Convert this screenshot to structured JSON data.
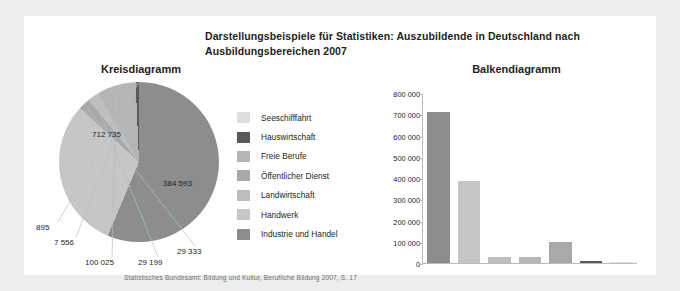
{
  "title": "Darstellungsbeispiele für Statistiken: Auszubildende in Deutschland nach Ausbildungsbereichen 2007",
  "pie_subtitle": "Kreisdiagramm",
  "bar_subtitle": "Balkendiagramm",
  "footer": "Statistisches Bundesamt: Bildung und Kultur, Berufliche Bildung 2007, S. 17",
  "legend": [
    {
      "label": "Seeschifffahrt",
      "color": "#dcdddd"
    },
    {
      "label": "Hauswirtschaft",
      "color": "#58595b"
    },
    {
      "label": "Freie Berufe",
      "color": "#b4b5b7"
    },
    {
      "label": "Öffentlicher Dienst",
      "color": "#a7a9ab"
    },
    {
      "label": "Landwirtschaft",
      "color": "#bdbec0"
    },
    {
      "label": "Handwerk",
      "color": "#c5c6c8"
    },
    {
      "label": "Industrie und Handel",
      "color": "#8b8d8f"
    }
  ],
  "chart_data": [
    {
      "type": "pie",
      "title": "Kreisdiagramm",
      "legend_position": "center",
      "categories": [
        "Industrie und Handel",
        "Handwerk",
        "Öffentlicher Dienst",
        "Landwirtschaft",
        "Freie Berufe",
        "Hauswirtschaft",
        "Seeschifffahrt"
      ],
      "values": [
        712735,
        384593,
        29333,
        29199,
        100025,
        7556,
        895
      ],
      "labels": [
        "712 735",
        "384 593",
        "29 333",
        "29 199",
        "100 025",
        "7 556",
        "895"
      ],
      "colors": [
        "#8b8d8f",
        "#c5c6c8",
        "#a7a9ab",
        "#bdbec0",
        "#b4b5b7",
        "#58595b",
        "#dcdddd"
      ],
      "total": 1264336
    },
    {
      "type": "bar",
      "title": "Balkendiagramm",
      "xlabel": "",
      "ylabel": "",
      "ylim": [
        0,
        800000
      ],
      "grid": false,
      "yticks": [
        800000,
        700000,
        600000,
        500000,
        400000,
        300000,
        200000,
        100000,
        0
      ],
      "ytick_labels": [
        "800 000",
        "700 000",
        "600 000",
        "500 000",
        "400 000",
        "300 000",
        "200 000",
        "100 000",
        "0"
      ],
      "categories": [
        "Industrie und Handel",
        "Handwerk",
        "Öffentlicher Dienst",
        "Landwirtschaft",
        "Freie Berufe",
        "Hauswirtschaft",
        "Seeschifffahrt"
      ],
      "values": [
        712735,
        384593,
        29333,
        29199,
        100025,
        7556,
        895
      ],
      "colors": [
        "#8b8d8f",
        "#c5c6c8",
        "#bdbec0",
        "#b4b5b7",
        "#a7a9ab",
        "#58595b",
        "#dcdddd"
      ]
    }
  ]
}
